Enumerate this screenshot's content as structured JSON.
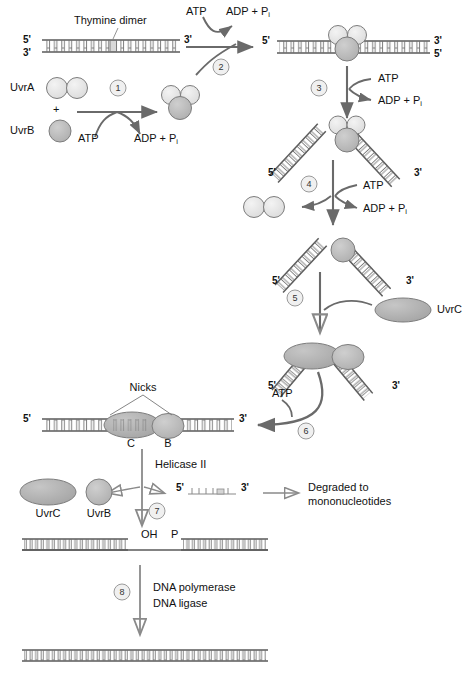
{
  "figure": {
    "colors": {
      "uvrA_light": "#e3e3e3",
      "uvrB_gray": "#b9b9b9",
      "uvrC_gray": "#b0b0b0",
      "dna_line": "#555555",
      "arrow": "#6a6a6a",
      "text": "#111111",
      "step_circle_fill": "#f0f0f0",
      "step_circle_stroke": "#9a9a9a"
    }
  },
  "labels": {
    "thymine_dimer": "Thymine dimer",
    "uvrA": "UvrA",
    "uvrB": "UvrB",
    "uvrC": "UvrC",
    "plus": "+",
    "atp": "ATP",
    "adp_pi": "ADP + P",
    "pi_sub": "i",
    "five_prime": "5'",
    "three_prime": "3'",
    "nicks": "Nicks",
    "c_subunit": "C",
    "b_subunit": "B",
    "helicase": "Helicase II",
    "degraded_line1": "Degraded to",
    "degraded_line2": "mononucleotides",
    "oh": "OH",
    "p": "P",
    "dna_polymerase": "DNA polymerase",
    "dna_ligase": "DNA ligase"
  },
  "steps": [
    {
      "n": "1",
      "caption": "UvrA dimer plus UvrB assemble using ATP"
    },
    {
      "n": "2",
      "caption": "UvrA2B complex binds damaged DNA, ATP hydrolyzed"
    },
    {
      "n": "3",
      "caption": "ATP-driven DNA bending at the lesion"
    },
    {
      "n": "4",
      "caption": "UvrA dimer released, ATP hydrolyzed"
    },
    {
      "n": "5",
      "caption": "UvrC binds the UvrB-DNA complex"
    },
    {
      "n": "6",
      "caption": "Dual incision produces nicks flanking the dimer"
    },
    {
      "n": "7",
      "caption": "Helicase II releases UvrC, UvrB and the excised fragment"
    },
    {
      "n": "8",
      "caption": "DNA polymerase and DNA ligase restore the duplex"
    }
  ],
  "step_numbers": [
    "1",
    "2",
    "3",
    "4",
    "5",
    "6",
    "7",
    "8"
  ],
  "panels": {
    "p1_dna": {
      "left_label": "5'",
      "left_label2": "3'",
      "right_label": "3'"
    },
    "p2_products": {
      "in": "ATP",
      "out": "ADP + P"
    },
    "p3_dna": {
      "left": "5'",
      "right_top": "3'",
      "right_bottom": "5'"
    },
    "p4_bent": {
      "left": "5'",
      "right": "3'"
    },
    "p5_bent": {
      "left": "5'",
      "right": "3'"
    },
    "p6_bent": {
      "left": "5'",
      "right": "3'"
    },
    "p7_nicked": {
      "left": "5'",
      "right": "3'"
    },
    "p8_fragment": {
      "left": "5'",
      "right": "3'"
    }
  }
}
